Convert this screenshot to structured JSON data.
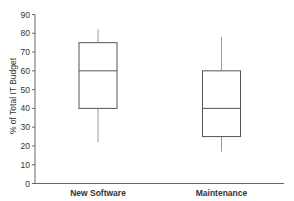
{
  "chart_data": {
    "type": "box",
    "title": "",
    "xlabel": "",
    "ylabel": "% of Total IT Budget",
    "ylim": [
      0,
      90
    ],
    "yticks": [
      0,
      10,
      20,
      30,
      40,
      50,
      60,
      70,
      80,
      90
    ],
    "grid": false,
    "legend": null,
    "categories": [
      "New Software",
      "Maintenance"
    ],
    "series": [
      {
        "name": "New Software",
        "min": 22,
        "q1": 40,
        "median": 60,
        "q3": 75,
        "max": 82
      },
      {
        "name": "Maintenance",
        "min": 17,
        "q1": 25,
        "median": 40,
        "q3": 60,
        "max": 78
      }
    ]
  },
  "colors": {
    "axis": "#666666",
    "box": "#555555",
    "whisker": "#999999",
    "text": "#333333"
  }
}
